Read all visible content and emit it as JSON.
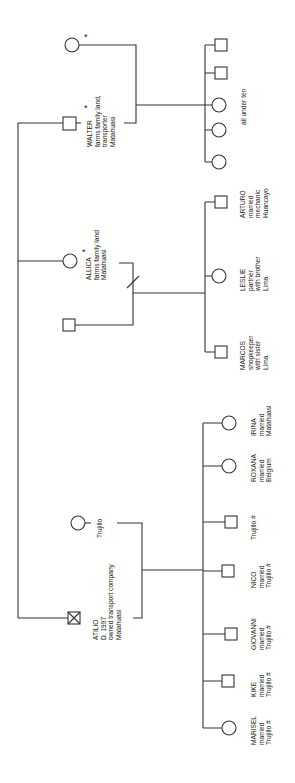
{
  "diagram": {
    "type": "kinship-genealogy",
    "orientation": "rotated-90-ccw",
    "line_color": "#333333",
    "symbols": {
      "male": "square",
      "female": "circle",
      "deceased": "crossed-square",
      "separation": "slash"
    }
  },
  "walter_family": {
    "walter": {
      "name": "WALTER",
      "lines": [
        "farms family land,",
        "transporter",
        "Matahuasi"
      ],
      "star": "*"
    },
    "spouse": {
      "star": "*"
    },
    "children_label": "all under ten",
    "children": [
      "male",
      "male",
      "female",
      "female",
      "female"
    ]
  },
  "allica_family": {
    "allica": {
      "name": "ALLICA",
      "lines": [
        "farms family land",
        "Matahuasi"
      ],
      "star": "*"
    },
    "children": [
      {
        "name": "ARTURO",
        "sex": "male",
        "lines": [
          "married",
          "mechanic",
          "Huancayo"
        ]
      },
      {
        "name": "LESLIE",
        "sex": "female",
        "lines": [
          "partner",
          "with brother",
          "Lima"
        ]
      },
      {
        "name": "MARCOS",
        "sex": "male",
        "lines": [
          "shopkeeper",
          "with sister",
          "Lima"
        ]
      }
    ]
  },
  "atilio_family": {
    "atilio": {
      "name": "ATILIO",
      "lines": [
        "D. 1997",
        "owned transport company",
        "Matahuasi"
      ]
    },
    "spouse": {
      "lines": [
        "Trujillo"
      ]
    },
    "children": [
      {
        "name": "IRINA",
        "sex": "female",
        "lines": [
          "married",
          "Matahuasi"
        ]
      },
      {
        "name": "ROXANA",
        "sex": "female",
        "lines": [
          "married",
          "Belgium"
        ]
      },
      {
        "name": "",
        "sex": "male",
        "lines": [
          "Trujillo #"
        ]
      },
      {
        "name": "NICO",
        "sex": "male",
        "lines": [
          "married",
          "Trujillo #"
        ]
      },
      {
        "name": "GIOVANNI",
        "sex": "male",
        "lines": [
          "married",
          "Trujillo #"
        ]
      },
      {
        "name": "KIKE",
        "sex": "male",
        "lines": [
          "married",
          "Trujillo #"
        ]
      },
      {
        "name": "MARISEL",
        "sex": "female",
        "lines": [
          "married",
          "Trujillo #"
        ]
      }
    ]
  }
}
